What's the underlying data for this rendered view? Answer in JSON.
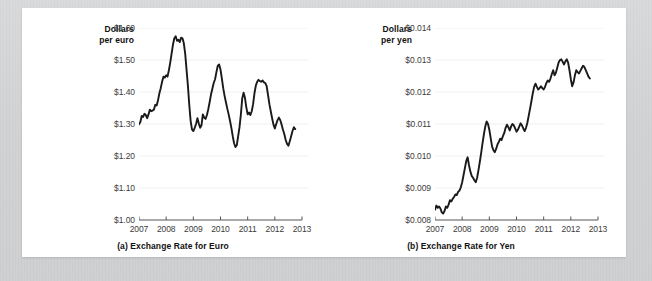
{
  "figure": {
    "background_color": "#ffffff",
    "page_background_color": "#d4d5d6",
    "line_color": "#1a1a1a",
    "grid_color": "#efefef",
    "axis_color": "#555555",
    "tick_label_color": "#3c3c3c"
  },
  "chart_data": [
    {
      "type": "line",
      "id": "exchange-rate-euro",
      "title": "(a) Exchange Rate for Euro",
      "ylabel": "Dollars per euro",
      "ylabel_line1": "Dollars",
      "ylabel_line2": "per euro",
      "xlabel": "",
      "grid": true,
      "grid_axis": "y",
      "legend": "none",
      "ylim": [
        1.0,
        1.6
      ],
      "yticks": [
        1.0,
        1.1,
        1.2,
        1.3,
        1.4,
        1.5,
        1.6
      ],
      "ytick_labels": [
        "$1.00",
        "$1.10",
        "$1.20",
        "$1.30",
        "$1.40",
        "$1.50",
        "$1.60"
      ],
      "xlim": [
        2007,
        2013
      ],
      "xticks": [
        2007,
        2008,
        2009,
        2010,
        2011,
        2012,
        2013
      ],
      "xtick_labels": [
        "2007",
        "2008",
        "2009",
        "2010",
        "2011",
        "2012",
        "2013"
      ],
      "series": [
        {
          "name": "Dollars per euro",
          "x": [
            2007.0,
            2007.05,
            2007.1,
            2007.15,
            2007.2,
            2007.25,
            2007.3,
            2007.35,
            2007.4,
            2007.45,
            2007.5,
            2007.55,
            2007.6,
            2007.65,
            2007.7,
            2007.75,
            2007.8,
            2007.85,
            2007.9,
            2007.95,
            2008.0,
            2008.05,
            2008.1,
            2008.15,
            2008.2,
            2008.25,
            2008.3,
            2008.35,
            2008.4,
            2008.45,
            2008.5,
            2008.55,
            2008.6,
            2008.65,
            2008.7,
            2008.75,
            2008.8,
            2008.85,
            2008.9,
            2008.95,
            2009.0,
            2009.05,
            2009.1,
            2009.15,
            2009.2,
            2009.25,
            2009.3,
            2009.35,
            2009.4,
            2009.45,
            2009.5,
            2009.55,
            2009.6,
            2009.65,
            2009.7,
            2009.75,
            2009.8,
            2009.85,
            2009.9,
            2009.95,
            2010.0,
            2010.05,
            2010.1,
            2010.15,
            2010.2,
            2010.25,
            2010.3,
            2010.35,
            2010.4,
            2010.45,
            2010.5,
            2010.55,
            2010.6,
            2010.65,
            2010.7,
            2010.75,
            2010.8,
            2010.85,
            2010.9,
            2010.95,
            2011.0,
            2011.05,
            2011.1,
            2011.15,
            2011.2,
            2011.25,
            2011.3,
            2011.35,
            2011.4,
            2011.45,
            2011.5,
            2011.55,
            2011.6,
            2011.65,
            2011.7,
            2011.75,
            2011.8,
            2011.85,
            2011.9,
            2011.95,
            2012.0,
            2012.05,
            2012.1,
            2012.15,
            2012.2,
            2012.25,
            2012.3,
            2012.35,
            2012.4,
            2012.45,
            2012.5,
            2012.55,
            2012.6,
            2012.65,
            2012.7,
            2012.75
          ],
          "values": [
            1.299,
            1.306,
            1.325,
            1.322,
            1.332,
            1.328,
            1.318,
            1.33,
            1.345,
            1.34,
            1.342,
            1.345,
            1.36,
            1.358,
            1.374,
            1.396,
            1.412,
            1.432,
            1.448,
            1.445,
            1.452,
            1.448,
            1.468,
            1.492,
            1.52,
            1.548,
            1.568,
            1.574,
            1.56,
            1.563,
            1.556,
            1.57,
            1.568,
            1.552,
            1.52,
            1.47,
            1.42,
            1.36,
            1.31,
            1.283,
            1.278,
            1.288,
            1.3,
            1.318,
            1.302,
            1.288,
            1.296,
            1.33,
            1.32,
            1.316,
            1.328,
            1.346,
            1.368,
            1.392,
            1.41,
            1.428,
            1.44,
            1.462,
            1.482,
            1.486,
            1.47,
            1.442,
            1.412,
            1.388,
            1.368,
            1.348,
            1.33,
            1.31,
            1.288,
            1.262,
            1.24,
            1.228,
            1.234,
            1.262,
            1.29,
            1.33,
            1.38,
            1.398,
            1.382,
            1.352,
            1.33,
            1.336,
            1.328,
            1.34,
            1.362,
            1.396,
            1.42,
            1.432,
            1.438,
            1.434,
            1.432,
            1.436,
            1.43,
            1.428,
            1.418,
            1.39,
            1.362,
            1.34,
            1.318,
            1.298,
            1.286,
            1.3,
            1.312,
            1.32,
            1.312,
            1.298,
            1.282,
            1.268,
            1.25,
            1.238,
            1.232,
            1.246,
            1.262,
            1.278,
            1.29,
            1.284
          ]
        }
      ]
    },
    {
      "type": "line",
      "id": "exchange-rate-yen",
      "title": "(b) Exchange Rate for Yen",
      "ylabel": "Dollars per yen",
      "ylabel_line1": "Dollars",
      "ylabel_line2": "per yen",
      "xlabel": "",
      "grid": true,
      "grid_axis": "y",
      "legend": "none",
      "ylim": [
        0.008,
        0.014
      ],
      "yticks": [
        0.008,
        0.009,
        0.01,
        0.011,
        0.012,
        0.013,
        0.014
      ],
      "ytick_labels": [
        "$0.008",
        "$0.009",
        "$0.010",
        "$0.011",
        "$0.012",
        "$0.013",
        "$0.014"
      ],
      "xlim": [
        2007,
        2013
      ],
      "xticks": [
        2007,
        2008,
        2009,
        2010,
        2011,
        2012,
        2013
      ],
      "xtick_labels": [
        "2007",
        "2008",
        "2009",
        "2010",
        "2011",
        "2012",
        "2013"
      ],
      "series": [
        {
          "name": "Dollars per yen",
          "x": [
            2007.0,
            2007.05,
            2007.1,
            2007.15,
            2007.2,
            2007.25,
            2007.3,
            2007.35,
            2007.4,
            2007.45,
            2007.5,
            2007.55,
            2007.6,
            2007.65,
            2007.7,
            2007.75,
            2007.8,
            2007.85,
            2007.9,
            2007.95,
            2008.0,
            2008.05,
            2008.1,
            2008.15,
            2008.2,
            2008.25,
            2008.3,
            2008.35,
            2008.4,
            2008.45,
            2008.5,
            2008.55,
            2008.6,
            2008.65,
            2008.7,
            2008.75,
            2008.8,
            2008.85,
            2008.9,
            2008.95,
            2009.0,
            2009.05,
            2009.1,
            2009.15,
            2009.2,
            2009.25,
            2009.3,
            2009.35,
            2009.4,
            2009.45,
            2009.5,
            2009.55,
            2009.6,
            2009.65,
            2009.7,
            2009.75,
            2009.8,
            2009.85,
            2009.9,
            2009.95,
            2010.0,
            2010.05,
            2010.1,
            2010.15,
            2010.2,
            2010.25,
            2010.3,
            2010.35,
            2010.4,
            2010.45,
            2010.5,
            2010.55,
            2010.6,
            2010.65,
            2010.7,
            2010.75,
            2010.8,
            2010.85,
            2010.9,
            2010.95,
            2011.0,
            2011.05,
            2011.1,
            2011.15,
            2011.2,
            2011.25,
            2011.3,
            2011.35,
            2011.4,
            2011.45,
            2011.5,
            2011.55,
            2011.6,
            2011.65,
            2011.7,
            2011.75,
            2011.8,
            2011.85,
            2011.9,
            2011.95,
            2012.0,
            2012.05,
            2012.1,
            2012.15,
            2012.2,
            2012.25,
            2012.3,
            2012.35,
            2012.4,
            2012.45,
            2012.5,
            2012.55,
            2012.6,
            2012.65,
            2012.7
          ],
          "values": [
            0.00832,
            0.00845,
            0.00838,
            0.00842,
            0.00836,
            0.00824,
            0.0082,
            0.00828,
            0.00842,
            0.00838,
            0.00848,
            0.00862,
            0.00858,
            0.00866,
            0.00872,
            0.0088,
            0.00878,
            0.00888,
            0.00892,
            0.00902,
            0.00918,
            0.0094,
            0.00962,
            0.00984,
            0.00996,
            0.00972,
            0.00952,
            0.00938,
            0.00932,
            0.00924,
            0.00918,
            0.00932,
            0.00956,
            0.00982,
            0.0101,
            0.0104,
            0.01068,
            0.01092,
            0.01108,
            0.011,
            0.01082,
            0.01056,
            0.0103,
            0.01018,
            0.01012,
            0.01022,
            0.01036,
            0.01044,
            0.01054,
            0.0105,
            0.01062,
            0.01072,
            0.01088,
            0.01098,
            0.0109,
            0.0108,
            0.01092,
            0.011,
            0.01096,
            0.01086,
            0.01076,
            0.01082,
            0.01092,
            0.01102,
            0.01096,
            0.01086,
            0.01078,
            0.01088,
            0.01104,
            0.01126,
            0.01148,
            0.01172,
            0.01196,
            0.01216,
            0.01226,
            0.01216,
            0.01208,
            0.01212,
            0.01218,
            0.01212,
            0.01208,
            0.01216,
            0.01228,
            0.01236,
            0.01232,
            0.01242,
            0.01256,
            0.01268,
            0.01252,
            0.0126,
            0.01276,
            0.01292,
            0.013,
            0.01302,
            0.01294,
            0.01286,
            0.01296,
            0.01302,
            0.01292,
            0.01268,
            0.0124,
            0.01218,
            0.0123,
            0.01252,
            0.01268,
            0.01262,
            0.01258,
            0.01266,
            0.01274,
            0.01282,
            0.01278,
            0.01268,
            0.01258,
            0.01248,
            0.01242
          ]
        }
      ]
    }
  ]
}
